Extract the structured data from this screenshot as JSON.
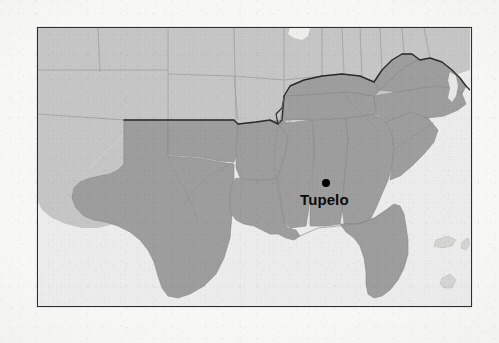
{
  "map": {
    "title": "Tupelo locator map",
    "region": "Southeastern United States",
    "frame": {
      "x": 37,
      "y": 27,
      "width": 435,
      "height": 280,
      "border_color": "#2e2e2e"
    },
    "colors": {
      "page_background": "#f7f7f6",
      "water": "#f0f0ef",
      "states_unshaded": "#c9c9c9",
      "states_shaded": "#a0a0a0",
      "state_border": "#8a8a8a",
      "highlight_border": "#2b2b2b",
      "marker": "#000000",
      "label": "#0a0a0a"
    },
    "marker": {
      "name": "Tupelo",
      "shape": "filled-circle",
      "x": 288,
      "y": 155,
      "radius": 4
    },
    "label": {
      "text": "Tupelo",
      "x": 262,
      "y": 163,
      "font_size": 15,
      "weight": "bold"
    },
    "legend": {
      "shaded_meaning": "Southern United States",
      "unshaded_meaning": "Other United States"
    },
    "shaded_states": [
      "Texas",
      "Oklahoma",
      "Arkansas",
      "Louisiana",
      "Mississippi",
      "Alabama",
      "Tennessee",
      "Kentucky",
      "Georgia",
      "Florida",
      "South Carolina",
      "North Carolina",
      "Virginia",
      "West Virginia"
    ],
    "unshaded_states": [
      "New Mexico",
      "Colorado",
      "Kansas",
      "Nebraska",
      "Iowa",
      "Missouri",
      "Illinois",
      "Indiana",
      "Ohio",
      "Pennsylvania",
      "Maryland"
    ],
    "water_bodies": [
      "Gulf of Mexico",
      "Atlantic Ocean",
      "Lake Michigan"
    ]
  }
}
